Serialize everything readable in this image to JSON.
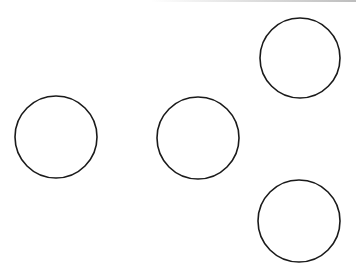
{
  "diagram": {
    "background": "#ffffff",
    "stroke_color": "#1a1a1a",
    "stroke_width": 1.6,
    "shapes": [
      {
        "id": "circle-left",
        "type": "circle",
        "cx": 56,
        "cy": 137,
        "r": 41
      },
      {
        "id": "circle-middle",
        "type": "circle",
        "cx": 198,
        "cy": 138,
        "r": 41
      },
      {
        "id": "circle-top-right",
        "type": "circle",
        "cx": 300,
        "cy": 58,
        "r": 40
      },
      {
        "id": "circle-bottom-right",
        "type": "circle",
        "cx": 299,
        "cy": 221,
        "r": 41
      }
    ]
  }
}
